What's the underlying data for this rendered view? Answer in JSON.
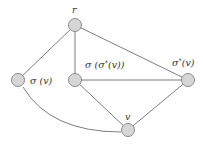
{
  "diagram": {
    "type": "graph",
    "colors": {
      "node_fill": "#d6d6d6",
      "node_stroke": "#8c8c8c",
      "edge": "#6e6e6e",
      "label": "#333333"
    },
    "nodes": [
      {
        "id": "r",
        "label": "r",
        "x": 75,
        "y": 25
      },
      {
        "id": "sigma_v",
        "label": "σ (v)",
        "x": 18,
        "y": 80
      },
      {
        "id": "sigma_sigmastar_v",
        "label": "σ (σ*(v))",
        "x": 75,
        "y": 80
      },
      {
        "id": "sigmastar_v",
        "label": "σ*(v)",
        "x": 188,
        "y": 80
      },
      {
        "id": "v",
        "label": "v",
        "x": 128,
        "y": 130
      }
    ],
    "edges": [
      {
        "from": "r",
        "to": "sigma_v",
        "shape": "straight"
      },
      {
        "from": "r",
        "to": "sigma_sigmastar_v",
        "shape": "straight"
      },
      {
        "from": "r",
        "to": "sigmastar_v",
        "shape": "straight"
      },
      {
        "from": "sigma_sigmastar_v",
        "to": "sigmastar_v",
        "shape": "straight"
      },
      {
        "from": "sigma_sigmastar_v",
        "to": "v",
        "shape": "straight"
      },
      {
        "from": "sigmastar_v",
        "to": "v",
        "shape": "straight"
      },
      {
        "from": "sigma_v",
        "to": "v",
        "shape": "curved"
      }
    ],
    "labels": {
      "r": "r",
      "sigma_v_base": "σ (v)",
      "sigma_sigmastar_prefix": "σ (σ",
      "sigma_sigmastar_star": "*",
      "sigma_sigmastar_suffix": "(v))",
      "sigmastar_prefix": "σ",
      "sigmastar_star": "*",
      "sigmastar_suffix": "(v)",
      "v": "v"
    }
  }
}
